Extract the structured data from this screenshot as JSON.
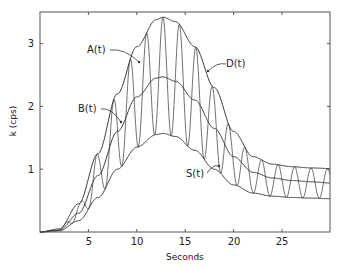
{
  "chart_data": {
    "type": "line",
    "title": "",
    "xlabel": "Seconds",
    "ylabel": "k (cps)",
    "xlim": [
      0,
      30
    ],
    "ylim": [
      0,
      3.5
    ],
    "xticks": [
      5,
      10,
      15,
      20,
      25
    ],
    "xtick_labels": [
      "5",
      "10",
      "15",
      "20",
      "25"
    ],
    "yticks": [
      1,
      2,
      3
    ],
    "ytick_labels": [
      "1",
      "2",
      "3"
    ],
    "grid": false,
    "legend": "none (curves labeled inline)",
    "x": [
      0,
      2,
      4,
      6,
      8,
      10,
      12,
      12.7,
      14,
      16,
      18,
      20,
      22,
      24,
      26,
      28,
      30
    ],
    "series": [
      {
        "name": "A(t)",
        "values": [
          0,
          0.05,
          0.45,
          1.25,
          2.2,
          2.95,
          3.38,
          3.42,
          3.35,
          2.95,
          2.3,
          1.6,
          1.2,
          1.08,
          1.04,
          1.02,
          1.01
        ]
      },
      {
        "name": "B(t)",
        "values": [
          0,
          0.03,
          0.3,
          0.9,
          1.6,
          2.15,
          2.45,
          2.47,
          2.4,
          2.1,
          1.65,
          1.2,
          0.95,
          0.86,
          0.82,
          0.8,
          0.78
        ]
      },
      {
        "name": "S(t)",
        "values": [
          0,
          0.02,
          0.18,
          0.55,
          1.0,
          1.35,
          1.55,
          1.57,
          1.52,
          1.3,
          1.0,
          0.75,
          0.62,
          0.57,
          0.55,
          0.54,
          0.53
        ]
      },
      {
        "name": "D(t)",
        "note": "oscillating signal between S(t) and A(t), period ~1.7 s",
        "period_s": 1.7
      }
    ],
    "annotations": [
      {
        "text": "A(t)",
        "points_to": "upper envelope",
        "near_x": 9.3
      },
      {
        "text": "B(t)",
        "points_to": "middle curve",
        "near_x": 8.2
      },
      {
        "text": "D(t)",
        "points_to": "oscillating signal",
        "near_x": 17.5
      },
      {
        "text": "S(t)",
        "points_to": "lower envelope",
        "near_x": 18.8
      }
    ]
  },
  "labels": {
    "A": "A(t)",
    "B": "B(t)",
    "D": "D(t)",
    "S": "S(t)",
    "xlabel": "Seconds",
    "ylabel": "k (cps)",
    "xt5": "5",
    "xt10": "10",
    "xt15": "15",
    "xt20": "20",
    "xt25": "25",
    "yt1": "1",
    "yt2": "2",
    "yt3": "3"
  }
}
